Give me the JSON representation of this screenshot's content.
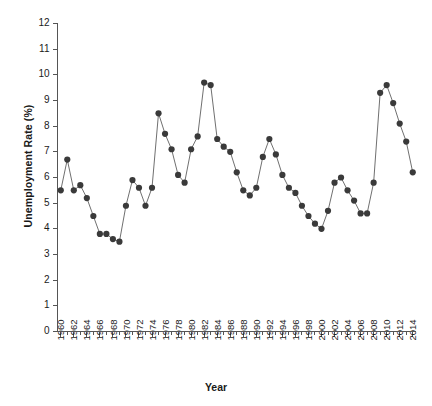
{
  "chart_data": {
    "type": "line",
    "title": "",
    "xlabel": "Year",
    "ylabel": "Unemployment Rate (%)",
    "xlim": [
      1959.5,
      2014.5
    ],
    "ylim": [
      0,
      12
    ],
    "ytick_step": 1,
    "xtick_step": 2,
    "grid": false,
    "legend": "none",
    "marker": "filled-circle",
    "x": [
      1960,
      1961,
      1962,
      1963,
      1964,
      1965,
      1966,
      1967,
      1968,
      1969,
      1970,
      1971,
      1972,
      1973,
      1974,
      1975,
      1976,
      1977,
      1978,
      1979,
      1980,
      1981,
      1982,
      1983,
      1984,
      1985,
      1986,
      1987,
      1988,
      1989,
      1990,
      1991,
      1992,
      1993,
      1994,
      1995,
      1996,
      1997,
      1998,
      1999,
      2000,
      2001,
      2002,
      2003,
      2004,
      2005,
      2006,
      2007,
      2008,
      2009,
      2010,
      2011,
      2012,
      2013,
      2014
    ],
    "values": [
      5.5,
      6.7,
      5.5,
      5.7,
      5.2,
      4.5,
      3.8,
      3.8,
      3.6,
      3.5,
      4.9,
      5.9,
      5.6,
      4.9,
      5.6,
      8.5,
      7.7,
      7.1,
      6.1,
      5.8,
      7.1,
      7.6,
      9.7,
      9.6,
      7.5,
      7.2,
      7.0,
      6.2,
      5.5,
      5.3,
      5.6,
      6.8,
      7.5,
      6.9,
      6.1,
      5.6,
      5.4,
      4.9,
      4.5,
      4.2,
      4.0,
      4.7,
      5.8,
      6.0,
      5.5,
      5.1,
      4.6,
      4.6,
      5.8,
      9.3,
      9.6,
      8.9,
      8.1,
      7.4,
      6.2
    ],
    "xtick_labels": [
      "1960",
      "1962",
      "1964",
      "1966",
      "1968",
      "1970",
      "1972",
      "1974",
      "1976",
      "1978",
      "1980",
      "1982",
      "1984",
      "1986",
      "1988",
      "1990",
      "1992",
      "1994",
      "1996",
      "1998",
      "2000",
      "2002",
      "2004",
      "2006",
      "2008",
      "2010",
      "2012",
      "2014"
    ],
    "ytick_labels": [
      "0",
      "1",
      "2",
      "3",
      "4",
      "5",
      "6",
      "7",
      "8",
      "9",
      "10",
      "11",
      "12"
    ],
    "colors": {
      "line": "#707070",
      "marker": "#3a3a3a",
      "axis": "#555555",
      "text": "#1a1a1a",
      "background": "#ffffff"
    }
  }
}
